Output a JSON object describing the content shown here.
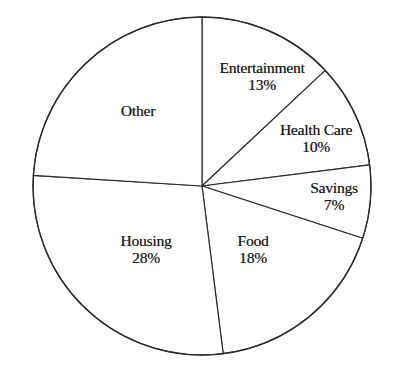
{
  "figure": {
    "background_color": "#ffffff",
    "line_color": "#2b2b2b",
    "text_color": "#141414",
    "width": 397,
    "height": 379
  },
  "chart_data": {
    "type": "pie",
    "title": "",
    "subtitle": "",
    "xlabel": "",
    "ylabel": "",
    "legend_position": "none",
    "grid": false,
    "labels_inside": true,
    "start_angle_deg": 90,
    "direction": "clockwise",
    "center_px": [
      202,
      186
    ],
    "radius_px": 169,
    "categories": [
      "Entertainment",
      "Health Care",
      "Savings",
      "Food",
      "Housing",
      "Other"
    ],
    "values": [
      13,
      10,
      7,
      18,
      28,
      24
    ],
    "value_unit": "%",
    "slices": [
      {
        "name": "Entertainment",
        "value": 13,
        "label": "Entertainment",
        "percent_text": "13%",
        "show_percent": true,
        "label_x": 262,
        "label_y": 76
      },
      {
        "name": "Health Care",
        "value": 10,
        "label": "Health Care",
        "percent_text": "10%",
        "show_percent": true,
        "label_x": 316,
        "label_y": 138
      },
      {
        "name": "Savings",
        "value": 7,
        "label": "Savings",
        "percent_text": "7%",
        "show_percent": true,
        "label_x": 334,
        "label_y": 196
      },
      {
        "name": "Food",
        "value": 18,
        "label": "Food",
        "percent_text": "18%",
        "show_percent": true,
        "label_x": 253,
        "label_y": 249
      },
      {
        "name": "Housing",
        "value": 28,
        "label": "Housing",
        "percent_text": "28%",
        "show_percent": true,
        "label_x": 146,
        "label_y": 249
      },
      {
        "name": "Other",
        "value": 24,
        "label": "Other",
        "percent_text": "",
        "show_percent": false,
        "label_x": 138,
        "label_y": 111
      }
    ]
  }
}
